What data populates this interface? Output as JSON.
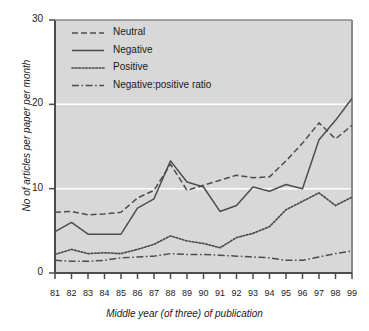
{
  "chart_data": {
    "type": "line",
    "title": "",
    "xlabel": "Middle year (of three) of publication",
    "ylabel": "No of articles per paper per month",
    "categories": [
      "81",
      "82",
      "83",
      "84",
      "85",
      "86",
      "87",
      "88",
      "89",
      "90",
      "91",
      "92",
      "93",
      "94",
      "95",
      "96",
      "97",
      "98",
      "99"
    ],
    "xlim": [
      81,
      99
    ],
    "ylim": [
      0,
      30
    ],
    "yticks": [
      0,
      10,
      20,
      30
    ],
    "ytick_labels": [
      "0",
      "10",
      "20",
      "30"
    ],
    "grid": "horizontal-white-gridlines",
    "legend_position": "top-left-inside",
    "plot_background": "#d8d8d8",
    "line_color": "#4d4d4d",
    "series": [
      {
        "name": "Neutral",
        "style": "dashed",
        "values": [
          7.2,
          7.3,
          6.9,
          7.0,
          7.2,
          8.9,
          9.8,
          12.9,
          9.8,
          10.4,
          11.0,
          11.6,
          11.3,
          11.4,
          13.3,
          15.4,
          17.8,
          15.9,
          17.5
        ]
      },
      {
        "name": "Negative",
        "style": "solid",
        "values": [
          4.9,
          6.0,
          4.6,
          4.6,
          4.6,
          7.7,
          8.8,
          13.3,
          10.8,
          10.2,
          7.3,
          8.0,
          10.2,
          9.7,
          10.5,
          10.0,
          15.8,
          18.1,
          20.7
        ]
      },
      {
        "name": "Positive",
        "style": "dotted",
        "values": [
          2.2,
          2.8,
          2.3,
          2.4,
          2.3,
          2.8,
          3.4,
          4.4,
          3.8,
          3.5,
          3.0,
          4.2,
          4.7,
          5.5,
          7.5,
          8.5,
          9.5,
          8.0,
          9.0
        ]
      },
      {
        "name": "Negative:positive ratio",
        "style": "dashdot",
        "values": [
          1.5,
          1.4,
          1.4,
          1.5,
          1.8,
          1.9,
          2.0,
          2.3,
          2.2,
          2.2,
          2.1,
          2.0,
          1.9,
          1.8,
          1.5,
          1.5,
          1.9,
          2.3,
          2.6
        ]
      }
    ]
  },
  "legend": {
    "items": [
      {
        "label": "Neutral"
      },
      {
        "label": "Negative"
      },
      {
        "label": "Positive"
      },
      {
        "label": "Negative:positive ratio"
      }
    ]
  }
}
